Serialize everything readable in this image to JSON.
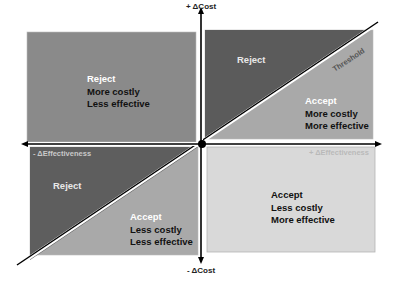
{
  "axes": {
    "y_positive": "+ ΔCost",
    "y_negative": "- ΔCost",
    "x_positive": "+ ΔEffectiveness",
    "x_negative": "- ΔEffectiveness"
  },
  "threshold_label": "Threshold",
  "quadrants": {
    "top_left": {
      "decision": "Reject",
      "lines": [
        "More costly",
        "Less effective"
      ]
    },
    "top_right_upper": {
      "decision": "Reject",
      "lines": []
    },
    "top_right_lower": {
      "decision": "Accept",
      "lines": [
        "More costly",
        "More effective"
      ]
    },
    "bottom_left_upper": {
      "decision": "Reject",
      "lines": []
    },
    "bottom_left_lower": {
      "decision": "Accept",
      "lines": [
        "Less costly",
        "Less effective"
      ]
    },
    "bottom_right": {
      "decision": "Accept",
      "lines": [
        "Less costly",
        "More effective"
      ]
    }
  },
  "colors": {
    "top_left_fill": "#8a8a8a",
    "dark_fill": "#5b5b5b",
    "mid_fill": "#a9a9a9",
    "light_fill": "#d9d9d9",
    "axis": "#000000",
    "decision_text_white": "#ffffff",
    "body_text": "#111111"
  }
}
